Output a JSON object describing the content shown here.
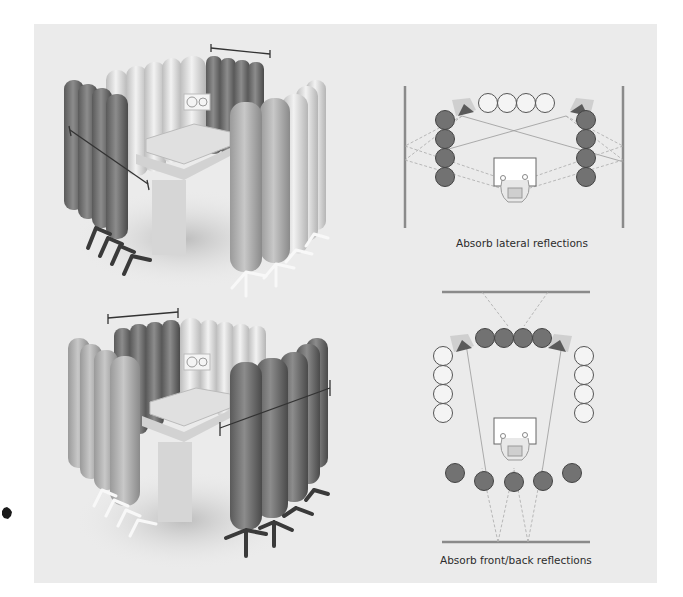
{
  "figure": {
    "panels": [
      {
        "id": "lateral",
        "caption": "Absorb lateral reflections",
        "render": {
          "description": "3D render of tube traps around mixing desk; dark tubes at sides, light tubes at front",
          "dark_tube_positions": [
            "left-side",
            "front-right"
          ],
          "light_tube_positions": [
            "front-center",
            "right-side"
          ]
        },
        "plan": {
          "front_tubes": {
            "count": 4,
            "type": "light"
          },
          "left_tubes": {
            "count": 4,
            "type": "dark"
          },
          "right_tubes": {
            "count": 4,
            "type": "dark"
          },
          "walls": [
            "left",
            "right"
          ]
        }
      },
      {
        "id": "front-back",
        "caption": "Absorb front/back reflections",
        "render": {
          "description": "3D render of tube traps around mixing desk; dark tubes at front and rear right, light tubes at sides",
          "dark_tube_positions": [
            "front-left",
            "rear-right"
          ],
          "light_tube_positions": [
            "left-side",
            "front-right"
          ]
        },
        "plan": {
          "front_tubes": {
            "count": 4,
            "type": "dark"
          },
          "left_tubes": {
            "count": 4,
            "type": "light"
          },
          "right_tubes": {
            "count": 4,
            "type": "light"
          },
          "rear_tubes": {
            "count": 5,
            "type": "dark"
          },
          "walls": [
            "front",
            "back"
          ]
        }
      }
    ],
    "colors": {
      "panel_bg": "#ebebeb",
      "dark_tube": "#6f6f6f",
      "light_tube": "#f4f4f4",
      "wall": "#8a8a8a",
      "caption": "#2b2b2b"
    }
  }
}
